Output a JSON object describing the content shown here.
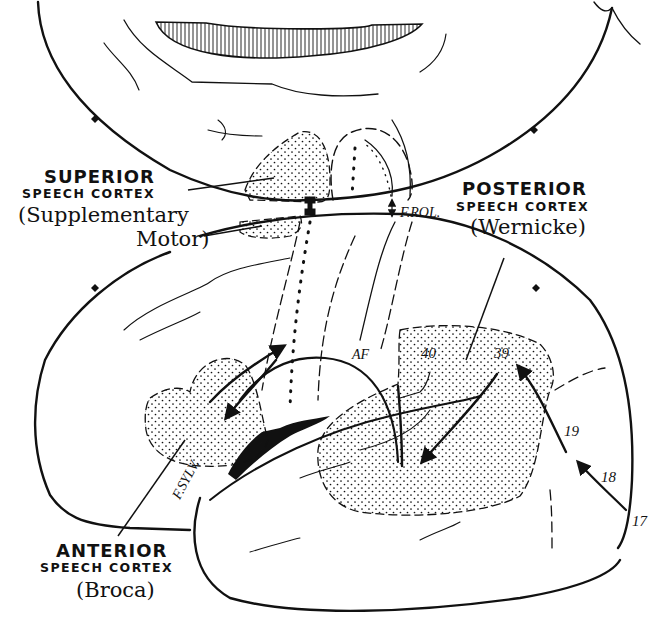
{
  "diagram": {
    "labels": {
      "superior": {
        "title": "SUPERIOR",
        "subtitle": "SPEECH CORTEX",
        "name_line1": "(Supplementary",
        "name_line2": "Motor)"
      },
      "posterior": {
        "title": "POSTERIOR",
        "subtitle": "SPEECH CORTEX",
        "name": "(Wernicke)"
      },
      "anterior": {
        "title": "ANTERIOR",
        "subtitle": "SPEECH CORTEX",
        "name": "(Broca)"
      }
    },
    "annotations": {
      "rolandic_fissure": "F.ROL.",
      "sylvian_fissure": "F.SYLV.",
      "arcuate_fasciculus": "AF"
    },
    "brodmann_areas": [
      "40",
      "39",
      "19",
      "18",
      "17"
    ],
    "colors": {
      "ink": "#111111",
      "background": "#ffffff"
    }
  }
}
